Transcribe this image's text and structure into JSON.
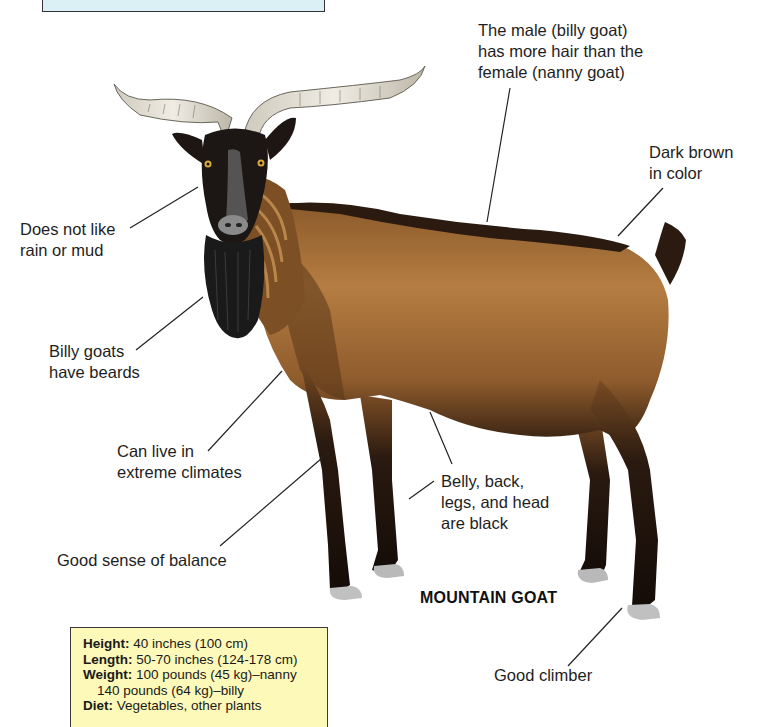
{
  "diagram": {
    "title": "MOUNTAIN GOAT",
    "colors": {
      "top_box_fill": "#daf0f4",
      "facts_box_fill": "#fdf9b8",
      "coat_brown": "#a0682f",
      "coat_dark": "#2a1a10",
      "horn": "#e4e0d6",
      "leader_line": "#222222"
    },
    "annotations": [
      {
        "id": "hair",
        "text": "The male (billy goat)\nhas more hair than the\nfemale (nanny goat)"
      },
      {
        "id": "color",
        "text": "Dark brown\nin color"
      },
      {
        "id": "rain",
        "text": "Does not like\nrain or mud"
      },
      {
        "id": "beard",
        "text": "Billy goats\nhave beards"
      },
      {
        "id": "climate",
        "text": "Can live in\nextreme climates"
      },
      {
        "id": "black",
        "text": "Belly, back,\nlegs, and head\nare black"
      },
      {
        "id": "balance",
        "text": "Good sense of balance"
      },
      {
        "id": "climber",
        "text": "Good climber"
      }
    ],
    "facts": {
      "height_key": "Height:",
      "height_val": "40 inches (100 cm)",
      "length_key": "Length:",
      "length_val": "50-70 inches (124-178 cm)",
      "weight_key": "Weight:",
      "weight_val": "100 pounds (45 kg)–nanny",
      "weight_val2": "140 pounds (64 kg)–billy",
      "diet_key": "Diet:",
      "diet_val": "Vegetables, other plants"
    }
  }
}
